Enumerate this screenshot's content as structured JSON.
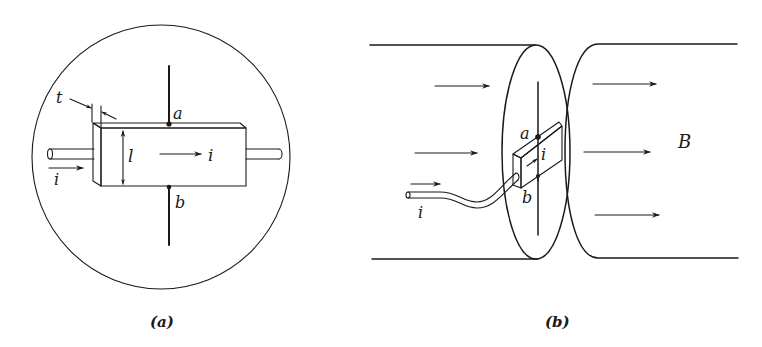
{
  "figure": {
    "panel_a": {
      "caption": "(a)",
      "labels": {
        "thickness": "t",
        "length": "l",
        "terminal_top": "a",
        "terminal_bottom": "b",
        "current_inside": "i",
        "current_input": "i"
      }
    },
    "panel_b": {
      "caption": "(b)",
      "labels": {
        "terminal_top": "a",
        "terminal_bottom": "b",
        "current_inside": "i",
        "current_input": "i",
        "field": "B"
      }
    },
    "colors": {
      "ink": "#1a1a1a",
      "background": "#ffffff"
    }
  }
}
